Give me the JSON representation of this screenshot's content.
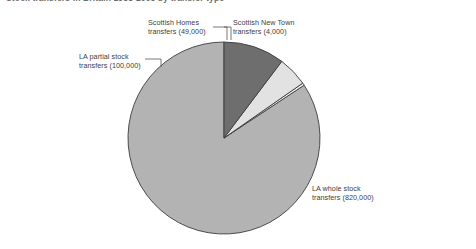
{
  "title": "Stock transfers in Britain 1988-2003 by transfer type",
  "chart_data": {
    "type": "pie",
    "title": "Stock transfers in Britain 1988-2003 by transfer type",
    "xlabel": "",
    "ylabel": "",
    "legend_position": "none",
    "grid": false,
    "total": 973000,
    "units": "dwellings",
    "start_angle_deg": 90,
    "direction": "counterclockwise",
    "categories": [
      "LA whole stock transfers",
      "Scottish New Town transfers",
      "Scottish Homes transfers",
      "LA partial stock transfers"
    ],
    "values": [
      820000,
      4000,
      49000,
      100000
    ],
    "value_labels": [
      "820,000",
      "4,000",
      "49,000",
      "100,000"
    ],
    "percentages": [
      84.3,
      0.4,
      5.0,
      10.3
    ],
    "colors": [
      "#b3b3b3",
      "#f2f2f2",
      "#e2e2e2",
      "#6e6e6e"
    ],
    "slices": [
      {
        "name": "LA whole stock transfers",
        "value": 820000,
        "value_label": "820,000",
        "percent": 84.3,
        "color": "#b3b3b3",
        "label_text_line1": "LA whole stock",
        "label_text_line2": "transfers (820,000)"
      },
      {
        "name": "Scottish New Town transfers",
        "value": 4000,
        "value_label": "4,000",
        "percent": 0.4,
        "color": "#f2f2f2",
        "label_text_line1": "Scottish New Town",
        "label_text_line2": "transfers (4,000)"
      },
      {
        "name": "Scottish Homes transfers",
        "value": 49000,
        "value_label": "49,000",
        "percent": 5.0,
        "color": "#e2e2e2",
        "label_text_line1": "Scottish Homes",
        "label_text_line2": "transfers (49,000)"
      },
      {
        "name": "LA partial stock transfers",
        "value": 100000,
        "value_label": "100,000",
        "percent": 10.3,
        "color": "#6e6e6e",
        "label_text_line1": "LA partial stock",
        "label_text_line2": "transfers (100,000)"
      }
    ]
  },
  "labels": {
    "scottish_homes": {
      "line1": "Scottish Homes",
      "line2": "transfers (49,000)"
    },
    "scottish_newtown": {
      "line1": "Scottish New Town",
      "line2": "transfers (4,000)"
    },
    "la_partial": {
      "line1": "LA partial stock",
      "line2": "transfers (100,000)"
    },
    "la_whole": {
      "line1": "LA whole stock",
      "line2": "transfers (820,000)"
    }
  },
  "geometry": {
    "center_x": 224,
    "center_y": 138,
    "radius": 96
  }
}
